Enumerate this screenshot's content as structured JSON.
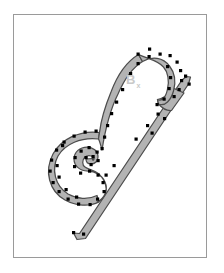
{
  "figure": {
    "frame": {
      "x": 13,
      "y": 14,
      "width": 194,
      "height": 244,
      "border_color": "#9a9a9a",
      "background_color": "#ffffff"
    },
    "style": {
      "band_fill_color": "#b3b3b3",
      "band_outline_color": "#4d4d4d",
      "vertex_color": "#000000",
      "label_color": "#c9c9c9",
      "page_background": "#ffffff"
    },
    "label": {
      "text": "B",
      "subscript": "x",
      "x": 126,
      "y": 73
    },
    "band": {
      "name": "ribbon-curve",
      "description": "self-intersecting ribbon with spiral loop, tall arch and diagonal tail",
      "outer_path": "M 100 202 L 84 208 L 74 203 L 63 194 L 56 183 L 54 169 L 57 156 L 65 145 L 77 138 L 90 136 L 100 139 L 107 145 L 110 152 L 110 159 L 105 165 L 97 167 L 91 163 L 89 156 L 93 151 L 99 152 L 100 157 L 96 160 L 93 157 L 95 154 L 99 155 L 97 158",
      "segments": [
        {
          "name": "outer-spiral",
          "d": "M 96 136 C 78 133 61 141 54 155 C 46 170 50 188 64 197 C 74 204 86 205 95 201"
        },
        {
          "name": "spiral-inner",
          "d": "M 101 148 C 93 143 83 144 78 151 C 73 158 75 167 82 171 C 88 174 94 172 97 168"
        },
        {
          "name": "arch-left-riser",
          "d": "M 100 143 C 103 128 106 110 112 95 C 118 79 127 65 140 58"
        },
        {
          "name": "arch-crown",
          "d": "M 140 58 C 152 53 164 55 171 64 C 176 71 177 80 175 88"
        },
        {
          "name": "arch-right-descender",
          "d": "M 175 88 C 172 99 165 108 157 116"
        },
        {
          "name": "branch-tip",
          "d": "M 157 110 L 186 77"
        },
        {
          "name": "diagonal-tail",
          "d": "M 168 99 L 74 238"
        }
      ],
      "vertex_count": 54,
      "vertices": [
        [
          96,
          131
        ],
        [
          85,
          132
        ],
        [
          74,
          136
        ],
        [
          64,
          142
        ],
        [
          57,
          150
        ],
        [
          52,
          160
        ],
        [
          51,
          171
        ],
        [
          54,
          182
        ],
        [
          60,
          191
        ],
        [
          69,
          198
        ],
        [
          79,
          203
        ],
        [
          90,
          203
        ],
        [
          99,
          199
        ],
        [
          104,
          192
        ],
        [
          103,
          183
        ],
        [
          99,
          176
        ],
        [
          92,
          172
        ],
        [
          85,
          172
        ],
        [
          79,
          175
        ],
        [
          75,
          170
        ],
        [
          75,
          163
        ],
        [
          79,
          157
        ],
        [
          85,
          153
        ],
        [
          92,
          152
        ],
        [
          96,
          156
        ],
        [
          95,
          162
        ],
        [
          90,
          165
        ],
        [
          86,
          162
        ],
        [
          88,
          157
        ],
        [
          103,
          148
        ],
        [
          105,
          137
        ],
        [
          108,
          126
        ],
        [
          112,
          114
        ],
        [
          117,
          102
        ],
        [
          123,
          90
        ],
        [
          131,
          74
        ],
        [
          140,
          64
        ],
        [
          150,
          57
        ],
        [
          160,
          54
        ],
        [
          170,
          55
        ],
        [
          177,
          60
        ],
        [
          181,
          69
        ],
        [
          182,
          79
        ],
        [
          180,
          89
        ],
        [
          176,
          98
        ],
        [
          171,
          106
        ],
        [
          165,
          113
        ],
        [
          160,
          106
        ],
        [
          172,
          93
        ],
        [
          181,
          84
        ],
        [
          186,
          76
        ],
        [
          178,
          80
        ],
        [
          160,
          118
        ],
        [
          150,
          130
        ],
        [
          140,
          142
        ],
        [
          130,
          154
        ],
        [
          120,
          166
        ],
        [
          110,
          178
        ],
        [
          100,
          190
        ],
        [
          90,
          202
        ],
        [
          80,
          214
        ],
        [
          73,
          232
        ],
        [
          83,
          234
        ]
      ]
    }
  }
}
